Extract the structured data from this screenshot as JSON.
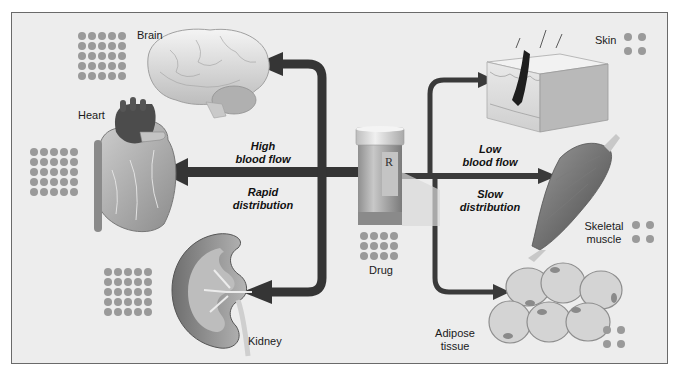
{
  "diagram": {
    "type": "drug-distribution",
    "center": {
      "label": "Drug",
      "icon": "prescription-bottle-icon",
      "rx_symbol": "R"
    },
    "flows": {
      "left": {
        "line1": "High",
        "line2": "blood flow",
        "line3": "Rapid",
        "line4": "distribution"
      },
      "right": {
        "line1": "Low",
        "line2": "blood flow",
        "line3": "Slow",
        "line4": "distribution"
      }
    },
    "organs": [
      {
        "name": "Brain",
        "group": "high",
        "dots": 25
      },
      {
        "name": "Heart",
        "group": "high",
        "dots": 25
      },
      {
        "name": "Kidney",
        "group": "high",
        "dots": 25
      },
      {
        "name": "Skin",
        "group": "low",
        "dots": 4
      },
      {
        "name": "Skeletal muscle",
        "line1": "Skeletal",
        "line2": "muscle",
        "group": "low",
        "dots": 4
      },
      {
        "name": "Adipose tissue",
        "line1": "Adipose",
        "line2": "tissue",
        "group": "low",
        "dots": 4
      }
    ],
    "drug_dots": 12,
    "colors": {
      "background": "#ededed",
      "border": "#6a6a6a",
      "arrow": "#3a3a3a",
      "dot": "#9a9a9a",
      "text": "#1a1a1a"
    }
  }
}
